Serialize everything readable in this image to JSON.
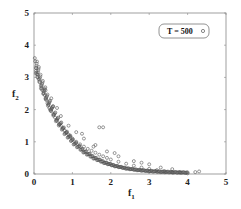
{
  "chart_data": {
    "type": "scatter",
    "title": "",
    "xlabel": "f1",
    "ylabel": "f2",
    "xlim": [
      0,
      5
    ],
    "ylim": [
      0,
      5
    ],
    "xticks": [
      "0",
      "1",
      "2",
      "3",
      "4",
      "5"
    ],
    "yticks": [
      "0",
      "1",
      "2",
      "3",
      "4",
      "5"
    ],
    "grid": false,
    "legend": {
      "position": "upper right",
      "entries": [
        "T = 500"
      ]
    },
    "series": [
      {
        "name": "T = 500",
        "marker": "circle-open",
        "color": "#555555",
        "points": [
          [
            0.02,
            3.6
          ],
          [
            0.03,
            3.5
          ],
          [
            0.05,
            3.3
          ],
          [
            0.06,
            3.15
          ],
          [
            0.08,
            3.1
          ],
          [
            0.1,
            3.0
          ],
          [
            0.12,
            2.95
          ],
          [
            0.15,
            2.85
          ],
          [
            0.18,
            2.75
          ],
          [
            0.2,
            2.65
          ],
          [
            0.22,
            2.6
          ],
          [
            0.25,
            2.5
          ],
          [
            0.28,
            2.45
          ],
          [
            0.3,
            2.35
          ],
          [
            0.32,
            2.3
          ],
          [
            0.35,
            2.2
          ],
          [
            0.38,
            2.15
          ],
          [
            0.4,
            2.05
          ],
          [
            0.42,
            2.0
          ],
          [
            0.45,
            1.95
          ],
          [
            0.5,
            1.85
          ],
          [
            0.55,
            1.75
          ],
          [
            0.6,
            1.65
          ],
          [
            0.65,
            1.55
          ],
          [
            0.7,
            1.5
          ],
          [
            0.75,
            1.42
          ],
          [
            0.8,
            1.35
          ],
          [
            0.85,
            1.28
          ],
          [
            0.9,
            1.22
          ],
          [
            0.95,
            1.15
          ],
          [
            1.0,
            1.1
          ],
          [
            1.1,
            1.0
          ],
          [
            1.2,
            0.92
          ],
          [
            1.3,
            0.85
          ],
          [
            1.4,
            0.78
          ],
          [
            1.5,
            0.72
          ],
          [
            1.6,
            0.66
          ],
          [
            1.7,
            0.6
          ],
          [
            1.8,
            0.55
          ],
          [
            1.9,
            0.5
          ],
          [
            2.0,
            0.45
          ],
          [
            2.2,
            0.38
          ],
          [
            2.4,
            0.32
          ],
          [
            2.6,
            0.26
          ],
          [
            2.8,
            0.2
          ],
          [
            3.0,
            0.16
          ],
          [
            3.2,
            0.12
          ],
          [
            3.4,
            0.09
          ],
          [
            3.6,
            0.06
          ],
          [
            3.8,
            0.04
          ],
          [
            4.0,
            0.02
          ],
          [
            4.2,
            0.06
          ],
          [
            4.3,
            0.08
          ],
          [
            0.3,
            2.6
          ],
          [
            0.5,
            2.1
          ],
          [
            0.7,
            1.8
          ],
          [
            0.9,
            1.5
          ],
          [
            1.1,
            1.3
          ],
          [
            1.3,
            1.1
          ],
          [
            1.6,
            0.9
          ],
          [
            1.9,
            0.7
          ],
          [
            2.2,
            0.55
          ],
          [
            2.6,
            0.4
          ],
          [
            3.0,
            0.3
          ],
          [
            1.7,
            1.45
          ],
          [
            1.8,
            1.45
          ],
          [
            1.55,
            0.85
          ],
          [
            1.25,
            1.25
          ],
          [
            0.45,
            2.35
          ],
          [
            0.6,
            2.05
          ],
          [
            2.1,
            0.65
          ],
          [
            2.8,
            0.35
          ],
          [
            3.3,
            0.2
          ],
          [
            3.6,
            0.15
          ]
        ]
      }
    ]
  },
  "plot_area": {
    "left": 34,
    "right": 226,
    "top": 13,
    "bottom": 174
  },
  "colors": {
    "axis": "#888888",
    "marker": "#555555",
    "legend_border": "#777777"
  },
  "axes": {
    "xlabel": "f",
    "xlabel_sub": "1",
    "ylabel": "f",
    "ylabel_sub": "2"
  },
  "legend": {
    "label": "T = 500",
    "marker": "circle-open"
  }
}
